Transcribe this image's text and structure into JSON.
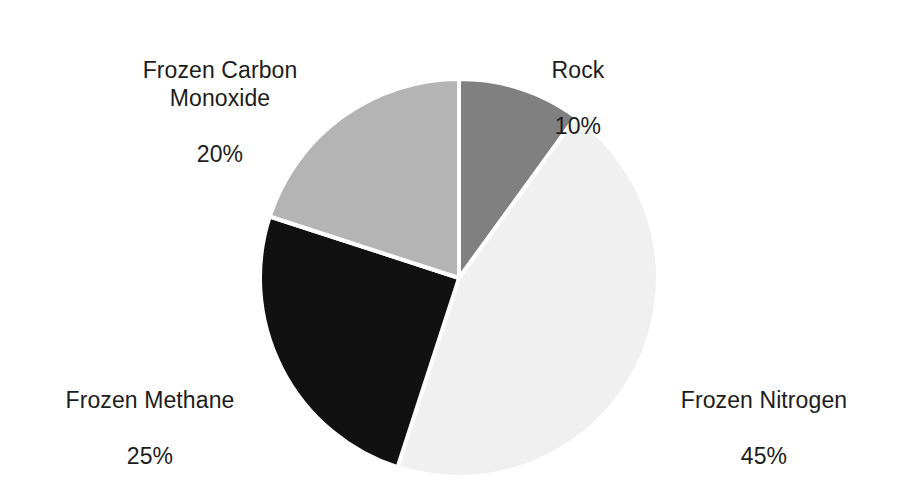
{
  "chart_data": {
    "type": "pie",
    "title": "",
    "subtitle": "",
    "xlabel": "",
    "ylabel": "",
    "grid": false,
    "legend": "none",
    "label_format": "name above percent",
    "start_angle_deg": 0,
    "direction": "clockwise",
    "background": "#ffffff",
    "separator_color": "#ffffff",
    "separator_width_px": 4,
    "center": {
      "x": 459,
      "y": 278
    },
    "radius": 199,
    "categories": [
      "Rock",
      "Frozen Nitrogen",
      "Frozen Methane",
      "Frozen Carbon Monoxide"
    ],
    "values": [
      10,
      45,
      25,
      20
    ],
    "unit": "%",
    "slices": [
      {
        "name": "Rock",
        "value": 10,
        "percent_text": "10%",
        "color": "#808080",
        "start_deg": 0,
        "end_deg": 36,
        "label_position": "upper-right"
      },
      {
        "name": "Frozen Nitrogen",
        "value": 45,
        "percent_text": "45%",
        "color": "#f0f0f0",
        "start_deg": 36,
        "end_deg": 198,
        "label_position": "lower-right"
      },
      {
        "name": "Frozen Methane",
        "value": 25,
        "percent_text": "25%",
        "color": "#111111",
        "start_deg": 198,
        "end_deg": 288,
        "label_position": "lower-left"
      },
      {
        "name": "Frozen Carbon Monoxide",
        "value": 20,
        "percent_text": "20%",
        "color": "#b4b4b4",
        "start_deg": 288,
        "end_deg": 360,
        "label_position": "upper-left"
      }
    ]
  },
  "labels": {
    "rock": {
      "name": "Rock",
      "value": "10%"
    },
    "frozen_nitrogen": {
      "name": "Frozen Nitrogen",
      "value": "45%"
    },
    "frozen_methane": {
      "name": "Frozen Methane",
      "value": "25%"
    },
    "frozen_carbon_monoxide": {
      "name": "Frozen Carbon\nMonoxide",
      "value": "20%"
    }
  }
}
